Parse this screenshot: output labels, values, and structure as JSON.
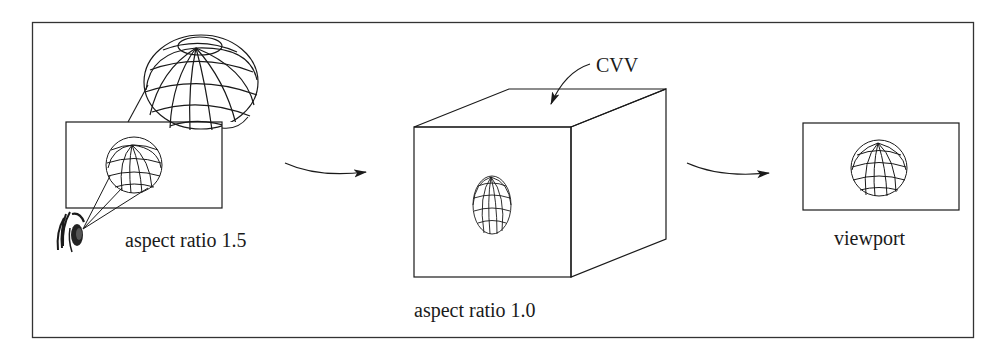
{
  "diagram": {
    "stages": [
      {
        "id": "world-window",
        "label": "aspect ratio 1.5",
        "description": "Eye views a sphere through a window"
      },
      {
        "id": "cvv",
        "label": "aspect ratio 1.0",
        "callout": "CVV",
        "description": "Canonical view volume cube with distorted (squashed) sphere"
      },
      {
        "id": "viewport",
        "label": "viewport",
        "description": "Sphere restored in viewport"
      }
    ],
    "arrows": [
      {
        "from": "world-window",
        "to": "cvv"
      },
      {
        "from": "cvv",
        "to": "viewport"
      }
    ],
    "colors": {
      "stroke": "#1a1a1a",
      "frame": "#333333",
      "background": "#ffffff"
    }
  }
}
